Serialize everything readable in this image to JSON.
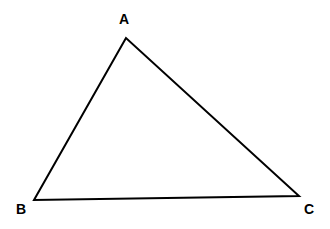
{
  "figure": {
    "name": "Triangle ABC",
    "background_color": "#ffffff",
    "stroke_color": "#000000",
    "stroke_width": 2,
    "fill_color": "none",
    "width": 330,
    "height": 229
  },
  "shape": {
    "type": "triangle",
    "points_attr": "126,38 34,200 299,196",
    "vertices": [
      {
        "id": "A",
        "label": "A",
        "x": 126,
        "y": 38,
        "label_x": 124,
        "label_y": 19
      },
      {
        "id": "B",
        "label": "B",
        "x": 34,
        "y": 200,
        "label_x": 21,
        "label_y": 209
      },
      {
        "id": "C",
        "label": "C",
        "x": 299,
        "y": 196,
        "label_x": 309,
        "label_y": 209
      }
    ],
    "edges": [
      {
        "id": "AB",
        "from": "A",
        "to": "B"
      },
      {
        "id": "BC",
        "from": "B",
        "to": "C"
      },
      {
        "id": "CA",
        "from": "C",
        "to": "A"
      }
    ]
  }
}
